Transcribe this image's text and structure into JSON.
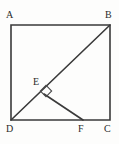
{
  "figure": {
    "type": "geometry-diagram",
    "background_color": "#fdfdfc",
    "stroke_color": "#3a3a3a",
    "label_color": "#2b2b2b",
    "canvas": {
      "width": 119,
      "height": 144
    },
    "square": {
      "name": "square-abcd",
      "corners": {
        "A": {
          "x": 11,
          "y": 25
        },
        "B": {
          "x": 110,
          "y": 25
        },
        "C": {
          "x": 110,
          "y": 120
        },
        "D": {
          "x": 11,
          "y": 120
        }
      },
      "stroke_width": 1.6
    },
    "segments": [
      {
        "name": "diagonal-db",
        "from": "D",
        "to": "B",
        "x1": 11,
        "y1": 120,
        "x2": 110,
        "y2": 25,
        "stroke_width": 1.6
      },
      {
        "name": "segment-ef",
        "from": "E",
        "to": "F",
        "x1": 44,
        "y1": 94,
        "x2": 83,
        "y2": 120,
        "stroke_width": 1.6
      }
    ],
    "points": {
      "E": {
        "x": 44,
        "y": 94,
        "on": "diagonal-db"
      },
      "F": {
        "x": 83,
        "y": 120,
        "on": "side-dc"
      }
    },
    "right_angle_marker": {
      "name": "right-angle-at-e",
      "vertex": "E",
      "center_x": 46,
      "center_y": 91,
      "size": 8,
      "rotation_deg": 45
    },
    "labels": [
      {
        "id": "A",
        "text": "A",
        "x": 6,
        "y": 10
      },
      {
        "id": "B",
        "text": "B",
        "x": 105,
        "y": 10
      },
      {
        "id": "E",
        "text": "E",
        "x": 33,
        "y": 77
      },
      {
        "id": "D",
        "text": "D",
        "x": 6,
        "y": 124
      },
      {
        "id": "F",
        "text": "F",
        "x": 78,
        "y": 124
      },
      {
        "id": "C",
        "text": "C",
        "x": 104,
        "y": 124
      }
    ]
  }
}
